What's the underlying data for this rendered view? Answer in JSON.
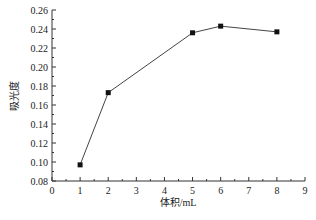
{
  "chart_data": {
    "type": "line",
    "title": "",
    "xlabel": "体积/mL",
    "ylabel": "吸光度",
    "x": [
      1,
      2,
      5,
      6,
      8
    ],
    "series": [
      {
        "name": "吸光度",
        "values": [
          0.097,
          0.173,
          0.236,
          0.243,
          0.237
        ],
        "marker": "square",
        "color": "#111111"
      }
    ],
    "xlim": [
      0,
      9
    ],
    "ylim": [
      0.08,
      0.26
    ],
    "xticks": [
      "0",
      "1",
      "2",
      "3",
      "4",
      "5",
      "6",
      "7",
      "8",
      "9"
    ],
    "yticks": [
      "0.08",
      "0.10",
      "0.12",
      "0.14",
      "0.16",
      "0.18",
      "0.20",
      "0.22",
      "0.24",
      "0.26"
    ],
    "grid": false,
    "legend": "none"
  }
}
